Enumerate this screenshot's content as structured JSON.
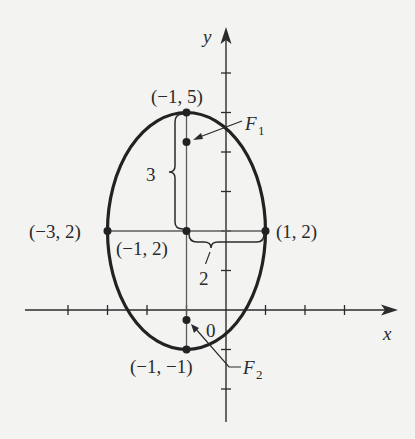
{
  "figure": {
    "type": "ellipse-diagram",
    "axes": {
      "x_label": "x",
      "y_label": "y",
      "origin_label": "0",
      "x_ticks": [
        -4,
        -3,
        -2,
        -1,
        1,
        2,
        3
      ],
      "y_ticks": [
        -2,
        -1,
        1,
        2,
        3,
        4,
        5,
        6
      ]
    },
    "ellipse": {
      "center": [
        -1,
        2
      ],
      "semi_major_vertical": 3,
      "semi_minor_horizontal": 2,
      "stroke_color": "#222222"
    },
    "points": [
      {
        "id": "top-vertex",
        "label": "(−1, 5)",
        "x": -1,
        "y": 5
      },
      {
        "id": "bottom-vertex",
        "label": "(−1, −1)",
        "x": -1,
        "y": -1
      },
      {
        "id": "left-vertex",
        "label": "(−3, 2)",
        "x": -3,
        "y": 2
      },
      {
        "id": "right-vertex",
        "label": "(1, 2)",
        "x": 1,
        "y": 2
      },
      {
        "id": "center",
        "label": "(−1, 2)",
        "x": -1,
        "y": 2
      }
    ],
    "foci": [
      {
        "id": "F1",
        "name": "F",
        "subscript": "1",
        "x": -1,
        "y": 4.236
      },
      {
        "id": "F2",
        "name": "F",
        "subscript": "2",
        "x": -1,
        "y": -0.236
      }
    ],
    "braces": [
      {
        "id": "vertical-brace",
        "label": "3",
        "from": [
          -1,
          2
        ],
        "to": [
          -1,
          5
        ]
      },
      {
        "id": "horizontal-brace",
        "label": "2",
        "from": [
          -1,
          2
        ],
        "to": [
          1,
          2
        ]
      }
    ]
  }
}
